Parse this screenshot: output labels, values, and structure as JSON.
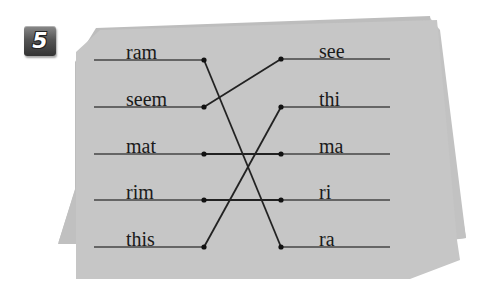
{
  "exercise": {
    "number": "5",
    "left_words": [
      "ram",
      "seem",
      "mat",
      "rim",
      "this"
    ],
    "right_words": [
      "see",
      "thi",
      "ma",
      "ri",
      "ra"
    ],
    "matches": [
      {
        "left": "ram",
        "right": "ra"
      },
      {
        "left": "seem",
        "right": "see"
      },
      {
        "left": "mat",
        "right": "ma"
      },
      {
        "left": "rim",
        "right": "ri"
      },
      {
        "left": "this",
        "right": "thi"
      }
    ]
  },
  "colors": {
    "paper": "#c4c4c4",
    "paper_back": "#b8b8b8",
    "line": "#2a2a2a",
    "badge": "#555555",
    "text": "#1a1a1a"
  }
}
